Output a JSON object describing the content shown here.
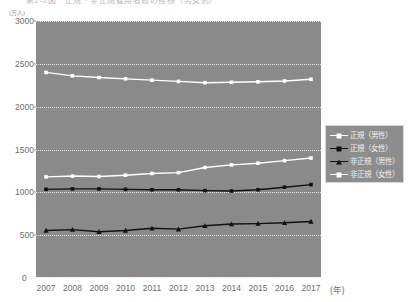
{
  "title": "第2-1図　正規・非正規雇用者数の推移（男女別）",
  "chart_data": {
    "type": "line",
    "title": "第2-1図　正規・非正規雇用者数の推移（男女別）",
    "xlabel": "(年)",
    "ylabel": "(万人)",
    "y_unit": "(万人)",
    "x_unit": "(年)",
    "ylim": [
      0,
      3000
    ],
    "ytick_step": 500,
    "ytick_labels": [
      "3000",
      "2500",
      "2000",
      "1500",
      "1000",
      "500",
      "0"
    ],
    "ytick_values": [
      3000,
      2500,
      2000,
      1500,
      1000,
      500,
      0
    ],
    "grid": true,
    "grid_style": "dotted",
    "legend_position": "right",
    "plot_background": "#8a8a8a",
    "page_background": "#ffffff",
    "categories": [
      "2007",
      "2008",
      "2009",
      "2010",
      "2011",
      "2012",
      "2013",
      "2014",
      "2015",
      "2016",
      "2017"
    ],
    "x": [
      2007,
      2008,
      2009,
      2010,
      2011,
      2012,
      2013,
      2014,
      2015,
      2016,
      2017
    ],
    "series": [
      {
        "name": "正規（男性）",
        "color": "#ffffff",
        "marker": "square",
        "marker_fill": "#ffffff",
        "values": [
          2400,
          2360,
          2340,
          2325,
          2310,
          2295,
          2280,
          2285,
          2290,
          2300,
          2320
        ]
      },
      {
        "name": "正規（女性）",
        "color": "#111111",
        "marker": "square",
        "marker_fill": "#111111",
        "values": [
          1035,
          1040,
          1040,
          1035,
          1030,
          1030,
          1020,
          1015,
          1030,
          1060,
          1090
        ]
      },
      {
        "name": "非正規（男性）",
        "color": "#111111",
        "marker": "triangle",
        "marker_fill": "#111111",
        "values": [
          555,
          565,
          540,
          555,
          580,
          570,
          610,
          630,
          635,
          645,
          660
        ]
      },
      {
        "name": "非正規（女性）",
        "color": "#ffffff",
        "marker": "square",
        "marker_fill": "#ffffff",
        "values": [
          1180,
          1190,
          1185,
          1200,
          1220,
          1230,
          1290,
          1320,
          1340,
          1370,
          1400
        ]
      }
    ]
  },
  "legend": {
    "items": [
      {
        "label": "正規（男性）",
        "color": "#ffffff",
        "marker": "square"
      },
      {
        "label": "正規（女性）",
        "color": "#111111",
        "marker": "square"
      },
      {
        "label": "非正規（男性）",
        "color": "#111111",
        "marker": "triangle"
      },
      {
        "label": "非正規（女性）",
        "color": "#ffffff",
        "marker": "square"
      }
    ]
  }
}
